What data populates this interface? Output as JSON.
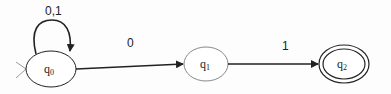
{
  "diagram": {
    "type": "DFA/NFA state diagram",
    "states": [
      {
        "id": "q0",
        "label": "q",
        "sub": "0",
        "initial": true,
        "accepting": false
      },
      {
        "id": "q1",
        "label": "q",
        "sub": "1",
        "initial": false,
        "accepting": false
      },
      {
        "id": "q2",
        "label": "q",
        "sub": "2",
        "initial": false,
        "accepting": true
      }
    ],
    "transitions": [
      {
        "from": "q0",
        "to": "q0",
        "label": "0,1"
      },
      {
        "from": "q0",
        "to": "q1",
        "label": "0"
      },
      {
        "from": "q1",
        "to": "q2",
        "label": "1"
      }
    ],
    "colors": {
      "stroke": "#222222",
      "background": "#fdfdfd"
    }
  }
}
